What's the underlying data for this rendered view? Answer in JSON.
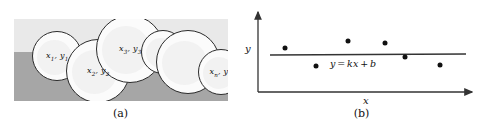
{
  "figure": {
    "width": 482,
    "height": 129,
    "background": "#ffffff"
  },
  "panel_a": {
    "caption": "(a)",
    "description": "bubbles-on-two-tone-band",
    "colors": {
      "band_light": "#e9e9e9",
      "band_dark": "#a6a6a6",
      "bubble_fill": "#fbfbfb",
      "bubble_stroke": "#2b2b2b"
    },
    "scene": {
      "x": 14,
      "y": 19,
      "width": 214,
      "height": 82,
      "horizon_y": 33
    },
    "bubbles": [
      {
        "cx": 43,
        "cy": 37,
        "r": 25,
        "label_html": "x<sub>1</sub>, y<sub>1</sub>",
        "label_text": "x1, y1",
        "labeled": true
      },
      {
        "cx": 84,
        "cy": 52,
        "r": 32,
        "label_html": "x<sub>2</sub>, y<sub>2</sub>",
        "label_text": "x2, y2",
        "labeled": true
      },
      {
        "cx": 116,
        "cy": 30,
        "r": 34,
        "label_html": "x<sub>3</sub>, y<sub>3</sub>",
        "label_text": "x3, y3",
        "labeled": true
      },
      {
        "cx": 149,
        "cy": 33,
        "r": 22,
        "label_html": "",
        "label_text": "",
        "labeled": false
      },
      {
        "cx": 174,
        "cy": 43,
        "r": 32,
        "label_html": "",
        "label_text": "",
        "labeled": false
      },
      {
        "cx": 207,
        "cy": 53,
        "r": 23,
        "label_html": "x<sub>n</sub>, y<sub>n</sub>",
        "label_text": "xn, yn",
        "labeled": true
      }
    ]
  },
  "panel_b": {
    "caption": "(b)",
    "y_axis_label": "y",
    "x_axis_label": "x",
    "line_equation_html": "y = kx + b",
    "line_equation_text": "y = kx + b",
    "axis_color": "#333333",
    "point_color": "#111111",
    "line_color": "#333333"
  },
  "chart_data": {
    "type": "scatter",
    "title": "",
    "xlabel": "x",
    "ylabel": "y",
    "grid": false,
    "legend": false,
    "axes": {
      "origin_px": {
        "x": 17,
        "y": 92
      },
      "x_axis_end_px": {
        "x": 231,
        "y": 92
      },
      "y_axis_top_px": {
        "x": 17,
        "y": 12
      }
    },
    "points_px": [
      {
        "x": 44,
        "y": 48
      },
      {
        "x": 75,
        "y": 66
      },
      {
        "x": 107,
        "y": 41
      },
      {
        "x": 144,
        "y": 43
      },
      {
        "x": 164,
        "y": 57
      },
      {
        "x": 199,
        "y": 65
      }
    ],
    "fit_line_px": {
      "x1": 29,
      "y1": 55,
      "x2": 225,
      "y2": 54
    },
    "fit_line_label": "y = kx + b",
    "series": [
      {
        "name": "observations",
        "x": [
          44,
          75,
          107,
          144,
          164,
          199
        ],
        "values": [
          48,
          66,
          41,
          43,
          57,
          65
        ]
      }
    ]
  }
}
